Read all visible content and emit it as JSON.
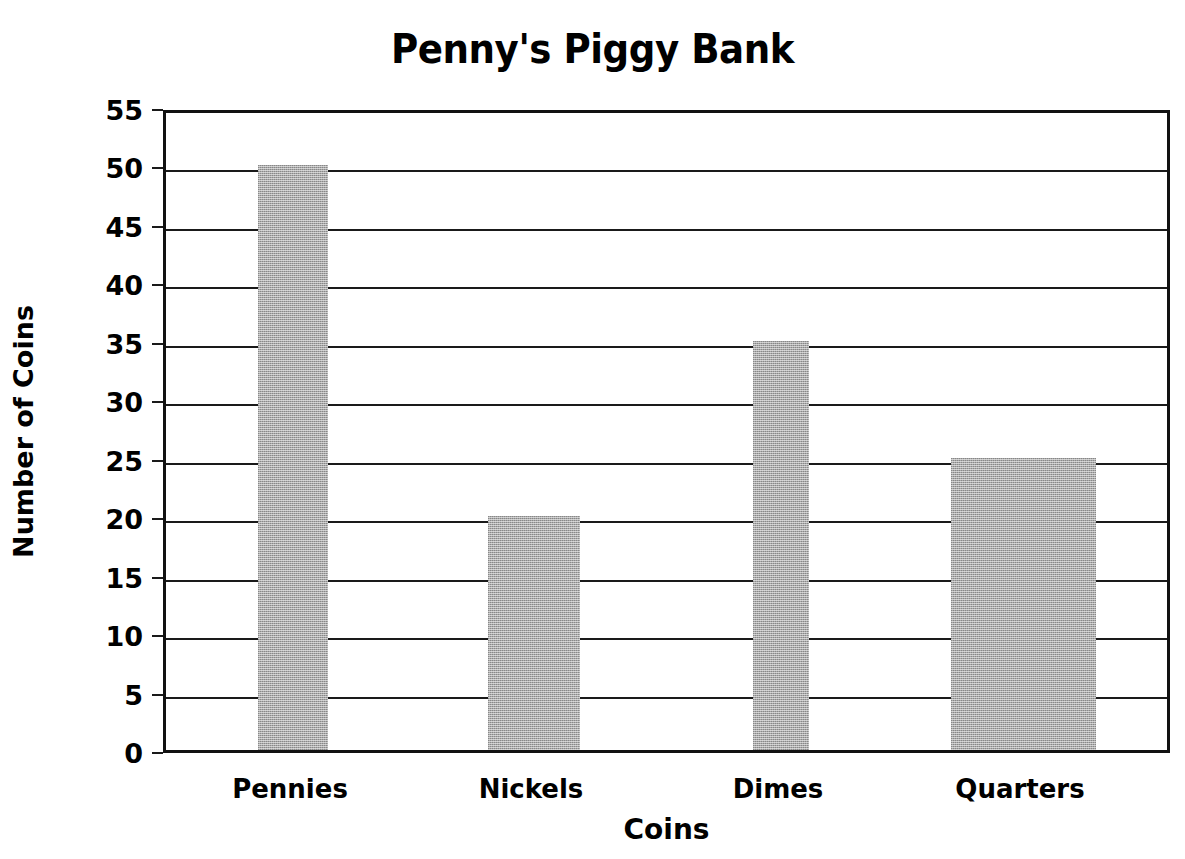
{
  "chart_data": {
    "type": "bar",
    "title": "Penny's Piggy Bank",
    "xlabel": "Coins",
    "ylabel": "Number of Coins",
    "categories": [
      "Pennies",
      "Nickels",
      "Dimes",
      "Quarters"
    ],
    "values": [
      50,
      20,
      35,
      25
    ],
    "ylim": [
      0,
      55
    ],
    "ytick_step": 5,
    "yticks": [
      "0",
      "5",
      "10",
      "15",
      "20",
      "25",
      "30",
      "35",
      "40",
      "45",
      "50",
      "55"
    ],
    "grid": true,
    "legend": null,
    "bar_color": "#a9a9a9",
    "axis_color": "#111111",
    "bar_widths_px": [
      70,
      92,
      56,
      145
    ],
    "bar_centers_px": [
      290,
      531,
      778,
      1020
    ]
  }
}
